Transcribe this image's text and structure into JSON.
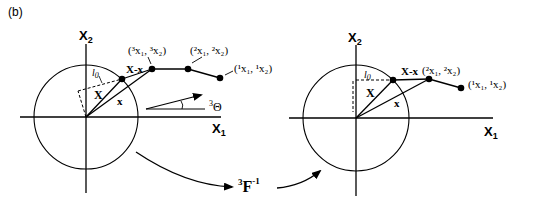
{
  "panel_label": "(b)",
  "left": {
    "axis_x_label": "X",
    "axis_x_sub": "1",
    "axis_y_label": "X",
    "axis_y_sub": "2",
    "l0_label": "l",
    "l0_sub": "0",
    "X_label": "X",
    "x_label": "x",
    "Xx_label": "X-x",
    "node3_label": "(³x₁, ³x₂)",
    "node2_label": "(²x₁, ²x₂)",
    "node1_label": "(¹x₁, ¹x₂)",
    "theta_sup": "3",
    "theta_label": "Θ"
  },
  "transform": {
    "sup": "3",
    "label": "F",
    "exp": "-1"
  },
  "right": {
    "axis_x_label": "X",
    "axis_x_sub": "1",
    "axis_y_label": "X",
    "axis_y_sub": "2",
    "l0_label": "l",
    "l0_sub": "0",
    "X_label": "X",
    "x_label": "x",
    "Xx_label": "X-x",
    "node2_label": "(²x₁, ²x₂)",
    "node1_label": "(¹x₁, ¹x₂)"
  },
  "colors": {
    "stroke": "#000000",
    "background": "#ffffff"
  }
}
